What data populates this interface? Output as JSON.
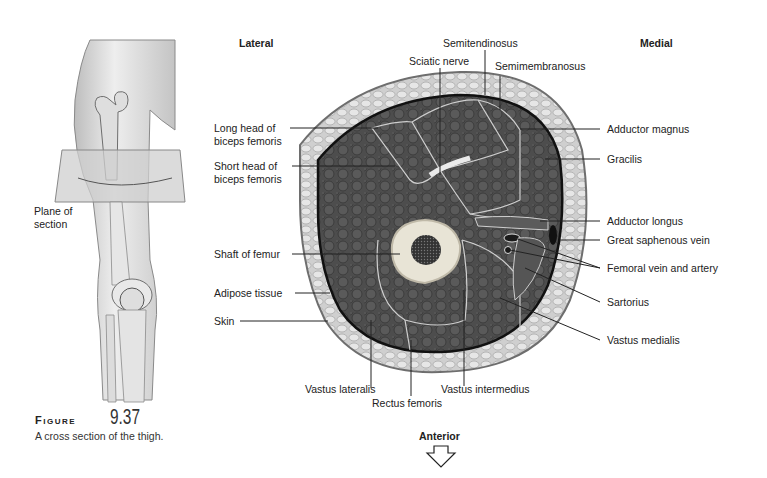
{
  "figure": {
    "word": "Figure",
    "number": "9.37",
    "caption": "A cross section of the thigh."
  },
  "orientation": {
    "lateral": "Lateral",
    "medial": "Medial",
    "anterior": "Anterior"
  },
  "inset": {
    "plane_label_line1": "Plane of",
    "plane_label_line2": "section"
  },
  "labels": {
    "semitendinosus": "Semitendinosus",
    "sciatic_nerve": "Sciatic nerve",
    "semimembranosus": "Semimembranosus",
    "long_head_1": "Long head of",
    "long_head_2": "biceps femoris",
    "short_head_1": "Short head of",
    "short_head_2": "biceps femoris",
    "adductor_magnus": "Adductor magnus",
    "gracilis": "Gracilis",
    "adductor_longus": "Adductor longus",
    "great_saphenous_vein": "Great saphenous vein",
    "femoral_vein_artery": "Femoral vein and artery",
    "sartorius": "Sartorius",
    "vastus_medialis": "Vastus medialis",
    "shaft_of_femur": "Shaft of femur",
    "adipose_tissue": "Adipose tissue",
    "skin": "Skin",
    "vastus_lateralis": "Vastus lateralis",
    "rectus_femoris": "Rectus femoris",
    "vastus_intermedius": "Vastus intermedius"
  },
  "colors": {
    "muscle": "#4a4a4a",
    "fat": "#d9d9d9",
    "bone": "#e8e4d6",
    "marrow": "#2a2a2a",
    "outline": "#111111"
  }
}
